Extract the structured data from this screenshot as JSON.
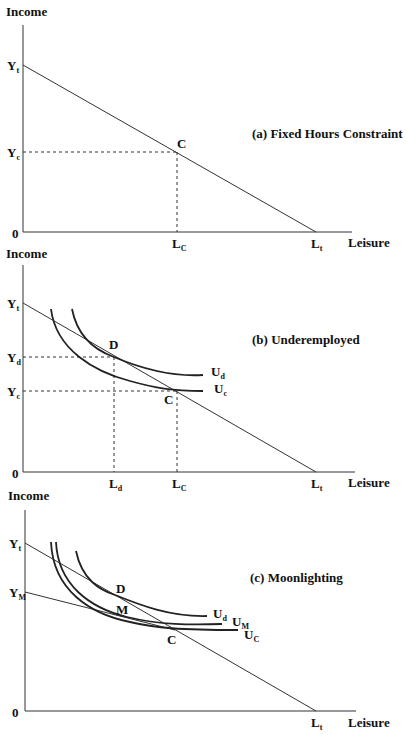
{
  "panels": [
    {
      "id": "a",
      "title": "(a) Fixed Hours Constraint",
      "y_axis_label": "Income",
      "x_axis_label": "Leisure",
      "origin_label": "0",
      "y_ticks": [
        {
          "main": "Y",
          "sub": "t"
        },
        {
          "main": "Y",
          "sub": "c"
        }
      ],
      "x_ticks": [
        {
          "main": "L",
          "sub": "C"
        },
        {
          "main": "L",
          "sub": "t"
        }
      ],
      "points": [
        "C"
      ],
      "curves": []
    },
    {
      "id": "b",
      "title": "(b) Underemployed",
      "y_axis_label": "Income",
      "x_axis_label": "Leisure",
      "origin_label": "0",
      "y_ticks": [
        {
          "main": "Y",
          "sub": "t"
        },
        {
          "main": "Y",
          "sub": "d"
        },
        {
          "main": "Y",
          "sub": "c"
        }
      ],
      "x_ticks": [
        {
          "main": "L",
          "sub": "d"
        },
        {
          "main": "L",
          "sub": "C"
        },
        {
          "main": "L",
          "sub": "t"
        }
      ],
      "points": [
        "D",
        "C"
      ],
      "curves": [
        {
          "main": "U",
          "sub": "d"
        },
        {
          "main": "U",
          "sub": "c"
        }
      ]
    },
    {
      "id": "c",
      "title": "(c) Moonlighting",
      "y_axis_label": "Income",
      "x_axis_label": "Leisure",
      "origin_label": "0",
      "y_ticks": [
        {
          "main": "Y",
          "sub": "t"
        },
        {
          "main": "Y",
          "sub": "M"
        }
      ],
      "x_ticks": [
        {
          "main": "L",
          "sub": "t"
        }
      ],
      "points": [
        "D",
        "M",
        "C"
      ],
      "curves": [
        {
          "main": "U",
          "sub": "d"
        },
        {
          "main": "U",
          "sub": "M"
        },
        {
          "main": "U",
          "sub": "C"
        }
      ]
    }
  ],
  "colors": {
    "line": "#222222",
    "background": "#ffffff"
  }
}
